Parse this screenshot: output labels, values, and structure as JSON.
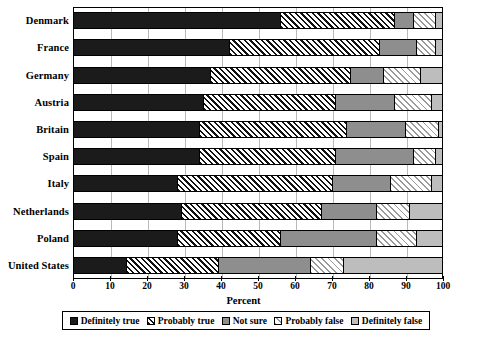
{
  "chart_data": {
    "type": "bar",
    "orientation": "horizontal",
    "stacked": true,
    "normalized": true,
    "title": "",
    "xlabel": "Percent",
    "ylabel": "",
    "xlim": [
      0,
      100
    ],
    "xticks": [
      0,
      10,
      20,
      30,
      40,
      50,
      60,
      70,
      80,
      90,
      100
    ],
    "grid": "vertical",
    "legend_position": "bottom",
    "categories": [
      "Denmark",
      "France",
      "Germany",
      "Austria",
      "Britain",
      "Spain",
      "Italy",
      "Netherlands",
      "Poland",
      "United States"
    ],
    "series": [
      {
        "name": "Definitely true",
        "fill": "solid-black",
        "color": "#1b1b1b",
        "values": [
          56,
          42,
          37,
          35,
          34,
          34,
          28,
          29,
          28,
          14
        ]
      },
      {
        "name": "Probably true",
        "fill": "dense-diagonal-hatch",
        "color": "#ffffff",
        "values": [
          31,
          41,
          38,
          36,
          40,
          37,
          42,
          38,
          28,
          25
        ]
      },
      {
        "name": "Not sure",
        "fill": "solid-mid-gray",
        "color": "#8e8e8e",
        "values": [
          5,
          10,
          9,
          16,
          16,
          21,
          16,
          15,
          26,
          25
        ]
      },
      {
        "name": "Probably false",
        "fill": "light-diagonal-hatch",
        "color": "#ffffff",
        "values": [
          6,
          5,
          10,
          10,
          9,
          6,
          11,
          9,
          11,
          9
        ]
      },
      {
        "name": "Definitely false",
        "fill": "solid-light-gray",
        "color": "#bdbdbd",
        "values": [
          2,
          2,
          6,
          3,
          1,
          2,
          3,
          9,
          7,
          27
        ]
      }
    ]
  },
  "axis": {
    "x_title": "Percent",
    "tick_labels": [
      "0",
      "10",
      "20",
      "30",
      "40",
      "50",
      "60",
      "70",
      "80",
      "90",
      "100"
    ]
  },
  "legend": {
    "items": [
      {
        "label": "Definitely true"
      },
      {
        "label": "Probably true"
      },
      {
        "label": "Not sure"
      },
      {
        "label": "Probably false"
      },
      {
        "label": "Definitely false"
      }
    ]
  }
}
